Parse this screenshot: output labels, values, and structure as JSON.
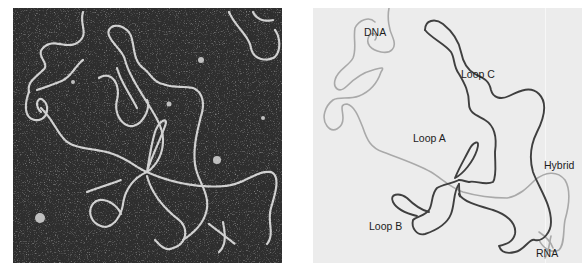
{
  "figure": {
    "left_panel": {
      "type": "electron-micrograph",
      "description": "Electron micrograph of DNA-RNA hybrid with R-loops",
      "background_color": "#2e2e2e",
      "strand_color": "#e6e6e6"
    },
    "right_panel": {
      "type": "interpretive-drawing",
      "background_color": "#ececec",
      "dna_color": "#a9a9a9",
      "loop_color": "#3f3f3f",
      "labels": {
        "dna": "DNA",
        "loop_c": "Loop C",
        "loop_a": "Loop A",
        "hybrid": "Hybrid",
        "loop_b": "Loop B",
        "rna": "RNA"
      }
    }
  }
}
